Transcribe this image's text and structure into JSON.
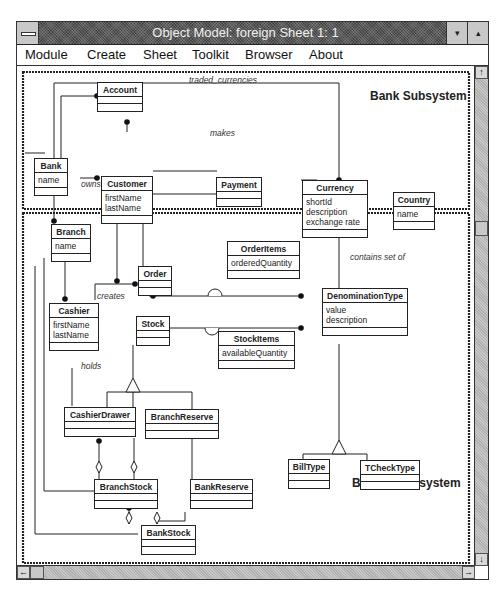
{
  "window": {
    "title": "Object Model: foreign  Sheet 1: 1",
    "minimize_glyph": "▾",
    "maximize_glyph": "▴"
  },
  "menu": {
    "items": [
      {
        "label": "Module"
      },
      {
        "label": "Create"
      },
      {
        "label": "Sheet"
      },
      {
        "label": "Toolkit"
      },
      {
        "label": "Browser"
      },
      {
        "label": "About"
      }
    ]
  },
  "diagram": {
    "subsystems": [
      {
        "label": "Bank Subsystem"
      },
      {
        "label": "Branch Subsystem"
      }
    ],
    "classes": {
      "account": {
        "name": "Account",
        "attrs": []
      },
      "bank": {
        "name": "Bank",
        "attrs": [
          "name"
        ]
      },
      "customer": {
        "name": "Customer",
        "attrs": [
          "firstName",
          "lastName"
        ]
      },
      "payment": {
        "name": "Payment",
        "attrs": []
      },
      "currency": {
        "name": "Currency",
        "attrs": [
          "shortId",
          "description",
          "exchange rate"
        ]
      },
      "country": {
        "name": "Country",
        "attrs": [
          "name"
        ]
      },
      "branch": {
        "name": "Branch",
        "attrs": [
          "name"
        ]
      },
      "orderitems": {
        "name": "OrderItems",
        "attrs": [
          "orderedQuantity"
        ]
      },
      "order": {
        "name": "Order",
        "attrs": []
      },
      "cashier": {
        "name": "Cashier",
        "attrs": [
          "firstName",
          "lastName"
        ]
      },
      "denominationtype": {
        "name": "DenominationType",
        "attrs": [
          "value",
          "description"
        ]
      },
      "stock": {
        "name": "Stock",
        "attrs": []
      },
      "stockitems": {
        "name": "StockItems",
        "attrs": [
          "availableQuantity"
        ]
      },
      "cashierdrawer": {
        "name": "CashierDrawer",
        "attrs": []
      },
      "branchreserve": {
        "name": "BranchReserve",
        "attrs": []
      },
      "billtype": {
        "name": "BillType",
        "attrs": []
      },
      "tchecktype": {
        "name": "TCheckType",
        "attrs": []
      },
      "branchstock": {
        "name": "BranchStock",
        "attrs": []
      },
      "bankreserve": {
        "name": "BankReserve",
        "attrs": []
      },
      "bankstock": {
        "name": "BankStock",
        "attrs": []
      }
    },
    "associations": {
      "traded_currencies": "traded_currencies",
      "makes": "makes",
      "owns": "owns",
      "pays": "pays",
      "contains_set_of": "contains set of",
      "creates": "creates",
      "holds": "holds"
    }
  },
  "scrollbars": {
    "up_arrow": "↑",
    "down_arrow": "↓",
    "left_arrow": "←",
    "right_arrow": "→"
  }
}
